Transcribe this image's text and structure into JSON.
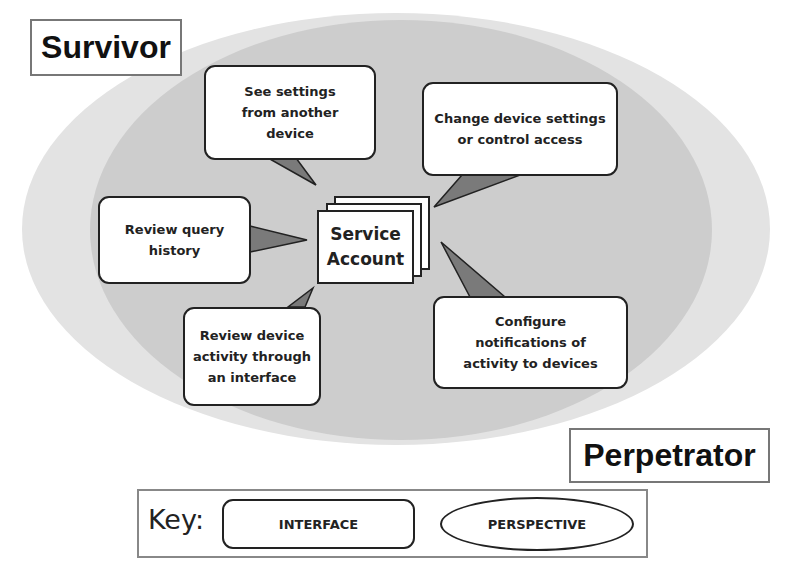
{
  "colors": {
    "outer_ellipse": "#e3e3e3",
    "inner_ellipse": "#cdcdcd",
    "callout_tail": "#7a7a7a",
    "border": "#222222"
  },
  "perspectives": {
    "survivor": "Survivor",
    "perpetrator": "Perpetrator"
  },
  "center": {
    "label": "Service\nAccount"
  },
  "interfaces": [
    {
      "label": "See settings\nfrom another\ndevice"
    },
    {
      "label": "Change device settings\nor control access"
    },
    {
      "label": "Review query\nhistory"
    },
    {
      "label": "Review device\nactivity through\nan interface"
    },
    {
      "label": "Configure\nnotifications of\nactivity to devices"
    }
  ],
  "key": {
    "title": "Key:",
    "interface": "INTERFACE",
    "perspective": "PERSPECTIVE"
  }
}
